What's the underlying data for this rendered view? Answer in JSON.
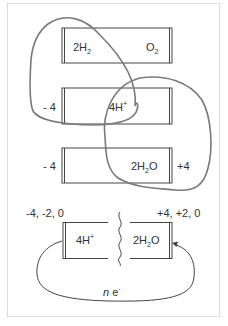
{
  "diagram": {
    "colors": {
      "frame": "#dddddd",
      "box_stroke": "#444444",
      "text": "#333333",
      "highlight_loop": "#7a7a7a"
    },
    "cell_top": {
      "left_species": {
        "base": "2H",
        "sub": "2"
      },
      "right_species": {
        "base": "O",
        "sub": "2"
      }
    },
    "cell_middle": {
      "left_oxidation": "- 4",
      "species": {
        "base": "4H",
        "sup": "+"
      }
    },
    "cell_bottom": {
      "left_oxidation": "- 4",
      "species": {
        "pre": "2H",
        "sub": "2",
        "post": "O"
      },
      "right_oxidation": "+4"
    },
    "circuit": {
      "left_states": "-4, -2, 0",
      "right_states": "+4, +2, 0",
      "left_species": {
        "base": "4H",
        "sup": "+"
      },
      "right_species": {
        "pre": "2H",
        "sub": "2",
        "post": "O"
      },
      "electron_flow": {
        "coef": "n",
        "base": "e",
        "sup": "-"
      }
    }
  }
}
